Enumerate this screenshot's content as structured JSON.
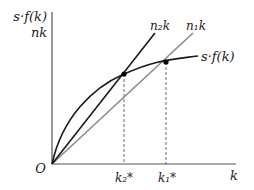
{
  "diagram": {
    "type": "solow-growth-steady-state",
    "y_axis_label_line1": "s·f(k)",
    "y_axis_label_line2": "nk",
    "x_axis_label": "k",
    "origin_label": "O",
    "curves": [
      {
        "name": "savings-curve",
        "label": "s·f(k)",
        "color": "#1a1a1a",
        "shape": "concave"
      },
      {
        "name": "n2-line",
        "label": "n₂k",
        "color": "#1a1a1a",
        "shape": "linear-steep"
      },
      {
        "name": "n1-line",
        "label": "n₁k",
        "color": "#8a8a8a",
        "shape": "linear-shallow"
      }
    ],
    "steady_states": [
      {
        "label": "k₂*",
        "intersects": "n₂k"
      },
      {
        "label": "k₁*",
        "intersects": "n₁k"
      }
    ],
    "labels": {
      "n2k": "n₂k",
      "n1k": "n₁k",
      "sfk": "s·f(k)",
      "k2star": "k₂*",
      "k1star": "k₁*"
    }
  }
}
